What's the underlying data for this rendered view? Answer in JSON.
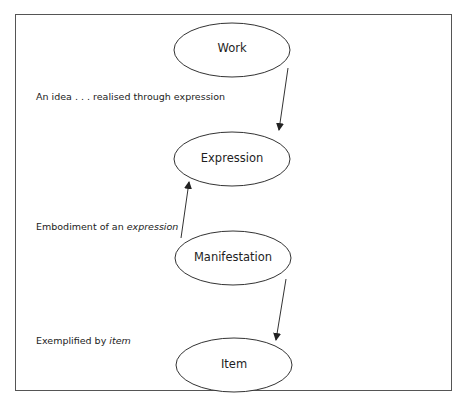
{
  "diagram": {
    "nodes": [
      {
        "id": "work",
        "label": "Work",
        "cx": 232,
        "cy": 50,
        "rx": 58,
        "ry": 27
      },
      {
        "id": "expression",
        "label": "Expression",
        "cx": 232,
        "cy": 159,
        "rx": 58,
        "ry": 27
      },
      {
        "id": "manifestation",
        "label": "Manifestation",
        "cx": 233,
        "cy": 258,
        "rx": 58,
        "ry": 27
      },
      {
        "id": "item",
        "label": "Item",
        "cx": 234,
        "cy": 365,
        "rx": 58,
        "ry": 27
      }
    ],
    "edges": [
      {
        "from": "work",
        "to": "expression",
        "x1": 288,
        "y1": 68,
        "x2": 279,
        "y2": 130
      },
      {
        "from": "manifestation",
        "to": "expression",
        "x1": 181,
        "y1": 238,
        "x2": 189,
        "y2": 182
      },
      {
        "from": "manifestation",
        "to": "item",
        "x1": 286,
        "y1": 279,
        "x2": 276,
        "y2": 340
      }
    ],
    "relations": [
      {
        "id": "work-expression",
        "text_plain": "An idea . . . realised through expression",
        "text_italic": ""
      },
      {
        "id": "manifestation-expression",
        "text_plain": "Embodiment of an ",
        "text_italic": "expression"
      },
      {
        "id": "manifestation-item",
        "text_plain": "Exemplified by ",
        "text_italic": "item"
      }
    ],
    "colors": {
      "stroke": "#333333",
      "frame": "#555555",
      "background": "#ffffff"
    }
  }
}
